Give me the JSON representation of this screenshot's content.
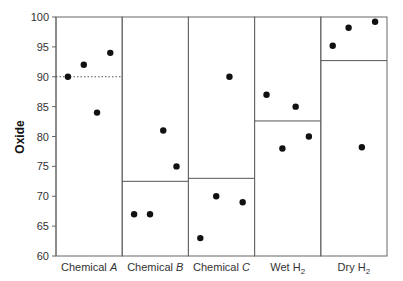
{
  "chart_data": {
    "type": "scatter",
    "title": "",
    "xlabel": "",
    "ylabel": "Oxide",
    "ylim": [
      60,
      100
    ],
    "yticks": [
      60,
      65,
      70,
      75,
      80,
      85,
      90,
      95,
      100
    ],
    "grid": false,
    "legend": null,
    "categories": [
      "Chemical A",
      "Chemical B",
      "Chemical C",
      "Wet H2",
      "Dry H2"
    ],
    "panels": [
      {
        "category": "Chemical A",
        "label_main": "Chemical ",
        "label_italic": "A",
        "label_sub": "",
        "points": [
          90,
          92,
          84,
          94
        ],
        "mean": 90,
        "mean_style": "dotted"
      },
      {
        "category": "Chemical B",
        "label_main": "Chemical ",
        "label_italic": "B",
        "label_sub": "",
        "points": [
          67,
          67,
          81,
          75
        ],
        "mean": 72.5,
        "mean_style": "solid"
      },
      {
        "category": "Chemical C",
        "label_main": "Chemical ",
        "label_italic": "C",
        "label_sub": "",
        "points": [
          63,
          70,
          90,
          69
        ],
        "mean": 73,
        "mean_style": "solid"
      },
      {
        "category": "Wet H2",
        "label_main": "Wet H",
        "label_italic": "",
        "label_sub": "2",
        "points": [
          87,
          78,
          85,
          80
        ],
        "mean": 82.6,
        "mean_style": "solid"
      },
      {
        "category": "Dry H2",
        "label_main": "Dry H",
        "label_italic": "",
        "label_sub": "2",
        "points": [
          95.2,
          98.2,
          78.2,
          99.2
        ],
        "mean": 92.7,
        "mean_style": "solid"
      }
    ],
    "colors": {
      "point": "#111111",
      "frame": "#666666",
      "mean_line": "#555555",
      "text": "#333333"
    }
  }
}
